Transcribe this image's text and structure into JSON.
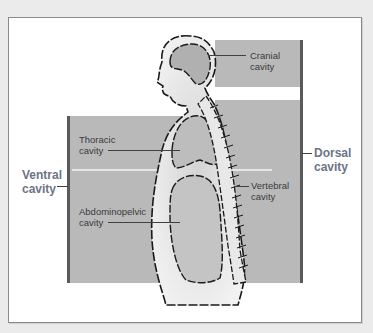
{
  "diagram": {
    "type": "anatomical-body-cavities",
    "figure": "Side-view human silhouette showing body cavities",
    "groups": {
      "ventral": {
        "label_line1": "Ventral",
        "label_line2": "cavity"
      },
      "dorsal": {
        "label_line1": "Dorsal",
        "label_line2": "cavity"
      }
    },
    "labels": {
      "cranial": {
        "line1": "Cranial",
        "line2": "cavity"
      },
      "thoracic": {
        "line1": "Thoracic",
        "line2": "cavity"
      },
      "abdominopelvic": {
        "line1": "Abdominopelvic",
        "line2": "cavity"
      },
      "vertebral": {
        "line1": "Vertebral",
        "line2": "cavity"
      }
    },
    "colors": {
      "cavity_fill": "#b9b9b9",
      "group_label": "#6c7487",
      "bracket": "#5a5a5a",
      "outline": "#1a1a1a"
    }
  }
}
